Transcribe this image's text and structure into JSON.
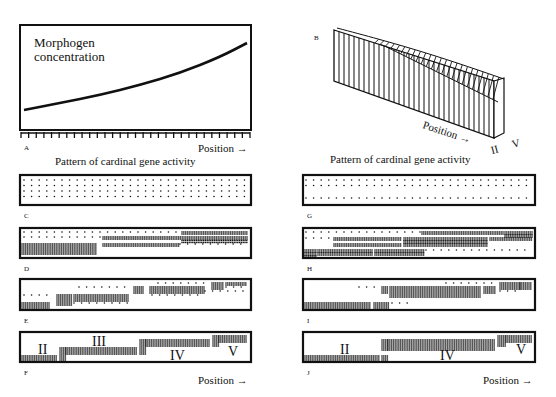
{
  "figure": {
    "panelA": {
      "letter": "A",
      "ylabel_line1": "Morphogen",
      "ylabel_line2": "concentration",
      "xlabel": "Position →",
      "ticks": 30,
      "box": [
        20,
        25,
        251,
        130
      ],
      "curve": [
        [
          24,
          110
        ],
        [
          60,
          103
        ],
        [
          100,
          95
        ],
        [
          140,
          85
        ],
        [
          180,
          73
        ],
        [
          220,
          57
        ],
        [
          247,
          43
        ]
      ]
    },
    "panelB": {
      "letter": "B",
      "xlabel": "Position →",
      "labels": [
        "II",
        "V"
      ]
    },
    "caption_left": "Pattern of cardinal gene activity",
    "caption_right": "Pattern of cardinal gene activity",
    "position_label": "Position →",
    "panels": [
      {
        "letter": "C",
        "box": [
          20,
          175,
          251,
          205
        ],
        "rows": [
          {
            "y": 180,
            "segs": [
              [
                24,
                247,
                "s"
              ]
            ]
          },
          {
            "y": 185.5,
            "segs": [
              [
                24,
                247,
                "s"
              ]
            ]
          },
          {
            "y": 191,
            "segs": [
              [
                24,
                247,
                "s"
              ]
            ]
          },
          {
            "y": 196.5,
            "segs": [
              [
                24,
                247,
                "s"
              ]
            ]
          }
        ],
        "labels": []
      },
      {
        "letter": "D",
        "box": [
          20,
          228,
          251,
          258
        ],
        "rows": [
          {
            "y": 232,
            "segs": [
              [
                24,
                180,
                "s"
              ],
              [
                182,
                247,
                "d"
              ]
            ]
          },
          {
            "y": 237,
            "segs": [
              [
                24,
                100,
                "s"
              ],
              [
                103,
                247,
                "d"
              ]
            ]
          },
          {
            "y": 240.5,
            "segs": [
              [
                182,
                247,
                "d"
              ]
            ]
          },
          {
            "y": 244,
            "segs": [
              [
                22,
                96,
                "d"
              ],
              [
                103,
                180,
                "d"
              ],
              [
                180,
                247,
                "s"
              ]
            ]
          },
          {
            "y": 248,
            "segs": [
              [
                22,
                96,
                "d"
              ]
            ]
          },
          {
            "y": 252,
            "segs": [
              [
                22,
                96,
                "d"
              ]
            ]
          }
        ],
        "labels": []
      },
      {
        "letter": "E",
        "box": [
          20,
          279,
          251,
          310
        ],
        "rows": [
          {
            "y": 283,
            "segs": [
              [
                158,
                208,
                "s"
              ],
              [
                212,
                223,
                "d"
              ],
              [
                226,
                247,
                "d"
              ]
            ]
          },
          {
            "y": 287,
            "segs": [
              [
                79,
                128,
                "s"
              ],
              [
                134,
                143,
                "d"
              ],
              [
                150,
                205,
                "d"
              ],
              [
                212,
                223,
                "d"
              ],
              [
                226,
                247,
                "s"
              ]
            ]
          },
          {
            "y": 291,
            "segs": [
              [
                134,
                143,
                "d"
              ],
              [
                150,
                205,
                "d"
              ],
              [
                205,
                247,
                "s"
              ]
            ]
          },
          {
            "y": 295,
            "segs": [
              [
                24,
                52,
                "s"
              ],
              [
                57,
                72,
                "d"
              ],
              [
                74,
                128,
                "d"
              ],
              [
                152,
                205,
                "s"
              ]
            ]
          },
          {
            "y": 299,
            "segs": [
              [
                57,
                72,
                "d"
              ],
              [
                74,
                128,
                "d"
              ]
            ]
          },
          {
            "y": 303,
            "segs": [
              [
                22,
                50,
                "d"
              ],
              [
                57,
                72,
                "d"
              ],
              [
                74,
                128,
                "s"
              ]
            ]
          },
          {
            "y": 307,
            "segs": [
              [
                22,
                50,
                "d"
              ]
            ]
          }
        ],
        "labels": []
      },
      {
        "letter": "F",
        "box": [
          20,
          332,
          251,
          362
        ],
        "rows": [
          {
            "y": 336,
            "segs": [
              [
                213,
                219,
                "d"
              ],
              [
                219,
                247,
                "d"
              ]
            ]
          },
          {
            "y": 340,
            "segs": [
              [
                140,
                146,
                "d"
              ],
              [
                146,
                210,
                "d"
              ],
              [
                213,
                219,
                "d"
              ],
              [
                219,
                247,
                "d"
              ]
            ]
          },
          {
            "y": 344,
            "segs": [
              [
                140,
                146,
                "d"
              ],
              [
                146,
                210,
                "d"
              ],
              [
                213,
                219,
                "d"
              ]
            ]
          },
          {
            "y": 348,
            "segs": [
              [
                60,
                66,
                "d"
              ],
              [
                66,
                137,
                "d"
              ],
              [
                140,
                146,
                "d"
              ]
            ]
          },
          {
            "y": 352,
            "segs": [
              [
                60,
                66,
                "d"
              ],
              [
                66,
                137,
                "d"
              ],
              [
                140,
                146,
                "d"
              ]
            ]
          },
          {
            "y": 356,
            "segs": [
              [
                22,
                57,
                "d"
              ],
              [
                60,
                66,
                "d"
              ]
            ]
          },
          {
            "y": 360,
            "segs": [
              [
                22,
                57,
                "d"
              ],
              [
                60,
                66,
                "d"
              ]
            ]
          }
        ],
        "labels": [
          {
            "text": "II",
            "x": 38,
            "y": 354
          },
          {
            "text": "III",
            "x": 92,
            "y": 346
          },
          {
            "text": "IV",
            "x": 170,
            "y": 360
          },
          {
            "text": "V",
            "x": 228,
            "y": 356
          }
        ]
      },
      {
        "letter": "G",
        "box": [
          303,
          175,
          535,
          205
        ],
        "rows": [
          {
            "y": 180,
            "segs": [
              [
                306,
                532,
                "s"
              ]
            ]
          },
          {
            "y": 185.5,
            "segs": [
              [
                306,
                532,
                "s"
              ]
            ]
          },
          {
            "y": 198,
            "segs": [
              [
                306,
                532,
                "s"
              ]
            ]
          }
        ],
        "labels": []
      },
      {
        "letter": "H",
        "box": [
          303,
          228,
          535,
          258
        ],
        "rows": [
          {
            "y": 232,
            "segs": [
              [
                306,
                420,
                "s"
              ],
              [
                422,
                503,
                "d"
              ],
              [
                505,
                532,
                "d"
              ]
            ]
          },
          {
            "y": 235,
            "segs": [
              [
                505,
                532,
                "d"
              ]
            ]
          },
          {
            "y": 238,
            "segs": [
              [
                306,
                330,
                "s"
              ],
              [
                334,
                402,
                "d"
              ],
              [
                404,
                488,
                "d"
              ],
              [
                490,
                532,
                "d"
              ]
            ]
          },
          {
            "y": 241,
            "segs": [
              [
                404,
                488,
                "d"
              ]
            ]
          },
          {
            "y": 244,
            "segs": [
              [
                334,
                402,
                "d"
              ],
              [
                404,
                488,
                "d"
              ]
            ]
          },
          {
            "y": 250,
            "segs": [
              [
                305,
                316,
                "d"
              ],
              [
                318,
                373,
                "d"
              ],
              [
                375,
                424,
                "d"
              ],
              [
                426,
                532,
                "s"
              ]
            ]
          },
          {
            "y": 253,
            "segs": [
              [
                305,
                316,
                "d"
              ],
              [
                318,
                373,
                "d"
              ],
              [
                375,
                424,
                "d"
              ]
            ]
          },
          {
            "y": 256,
            "segs": [
              [
                305,
                316,
                "d"
              ]
            ]
          }
        ],
        "labels": []
      },
      {
        "letter": "I",
        "box": [
          303,
          279,
          535,
          310
        ],
        "rows": [
          {
            "y": 283,
            "segs": [
              [
                446,
                496,
                "s"
              ],
              [
                500,
                520,
                "d"
              ],
              [
                520,
                532,
                "d"
              ]
            ]
          },
          {
            "y": 287,
            "segs": [
              [
                359,
                375,
                "s"
              ],
              [
                382,
                388,
                "d"
              ],
              [
                390,
                480,
                "d"
              ],
              [
                484,
                496,
                "d"
              ],
              [
                500,
                520,
                "d"
              ],
              [
                520,
                532,
                "d"
              ]
            ]
          },
          {
            "y": 291,
            "segs": [
              [
                382,
                388,
                "d"
              ],
              [
                390,
                480,
                "d"
              ],
              [
                484,
                496,
                "d"
              ],
              [
                500,
                520,
                "s"
              ]
            ]
          },
          {
            "y": 295,
            "segs": [
              [
                390,
                480,
                "d"
              ]
            ]
          },
          {
            "y": 303,
            "segs": [
              [
                305,
                371,
                "d"
              ],
              [
                374,
                390,
                "d"
              ],
              [
                392,
                408,
                "s"
              ]
            ]
          },
          {
            "y": 307,
            "segs": [
              [
                305,
                371,
                "d"
              ],
              [
                374,
                390,
                "d"
              ]
            ]
          }
        ],
        "labels": []
      },
      {
        "letter": "J",
        "box": [
          303,
          332,
          535,
          362
        ],
        "rows": [
          {
            "y": 336,
            "segs": [
              [
                498,
                506,
                "d"
              ],
              [
                506,
                532,
                "d"
              ]
            ]
          },
          {
            "y": 340,
            "segs": [
              [
                382,
                388,
                "d"
              ],
              [
                388,
                495,
                "d"
              ],
              [
                498,
                506,
                "d"
              ],
              [
                506,
                532,
                "d"
              ]
            ]
          },
          {
            "y": 344,
            "segs": [
              [
                382,
                388,
                "d"
              ],
              [
                388,
                495,
                "d"
              ],
              [
                498,
                506,
                "d"
              ]
            ]
          },
          {
            "y": 348,
            "segs": [
              [
                382,
                388,
                "d"
              ],
              [
                388,
                495,
                "d"
              ]
            ]
          },
          {
            "y": 356,
            "segs": [
              [
                305,
                380,
                "d"
              ],
              [
                382,
                388,
                "d"
              ]
            ]
          },
          {
            "y": 360,
            "segs": [
              [
                305,
                380,
                "d"
              ],
              [
                382,
                388,
                "d"
              ]
            ]
          }
        ],
        "labels": [
          {
            "text": "II",
            "x": 340,
            "y": 354
          },
          {
            "text": "IV",
            "x": 440,
            "y": 360
          },
          {
            "text": "V",
            "x": 516,
            "y": 354
          }
        ]
      }
    ]
  }
}
